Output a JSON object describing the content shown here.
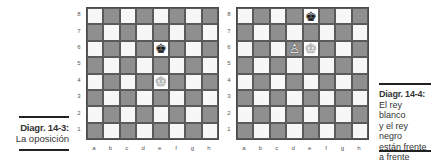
{
  "diagrams": [
    {
      "id": "left",
      "caption": {
        "title": "Diagr. 14-3:",
        "lines": [
          "La oposición"
        ]
      },
      "ranks": [
        "8",
        "7",
        "6",
        "5",
        "4",
        "3",
        "2",
        "1"
      ],
      "files": [
        "a",
        "b",
        "c",
        "d",
        "e",
        "f",
        "g",
        "h"
      ],
      "pieces": [
        {
          "square": "e6",
          "piece": "black-king",
          "glyph": "♚"
        },
        {
          "square": "e4",
          "piece": "white-king",
          "glyph": "♔"
        }
      ]
    },
    {
      "id": "right",
      "caption": {
        "title": "Diagr. 14-4:",
        "lines": [
          "El rey blanco",
          "y el rey negro",
          "están frente",
          "a frente"
        ]
      },
      "ranks": [
        "8",
        "7",
        "6",
        "5",
        "4",
        "3",
        "2",
        "1"
      ],
      "files": [
        "a",
        "b",
        "c",
        "d",
        "e",
        "f",
        "g",
        "h"
      ],
      "pieces": [
        {
          "square": "e8",
          "piece": "black-king",
          "glyph": "♚"
        },
        {
          "square": "e6",
          "piece": "white-king",
          "glyph": "♔"
        },
        {
          "square": "d6",
          "piece": "white-pawn",
          "glyph": "♙"
        }
      ]
    }
  ],
  "colors": {
    "light_square": "#f7f7f7",
    "dark_square": "#8f8f8f",
    "border": "#4a4a4a",
    "rule": "#222222"
  }
}
